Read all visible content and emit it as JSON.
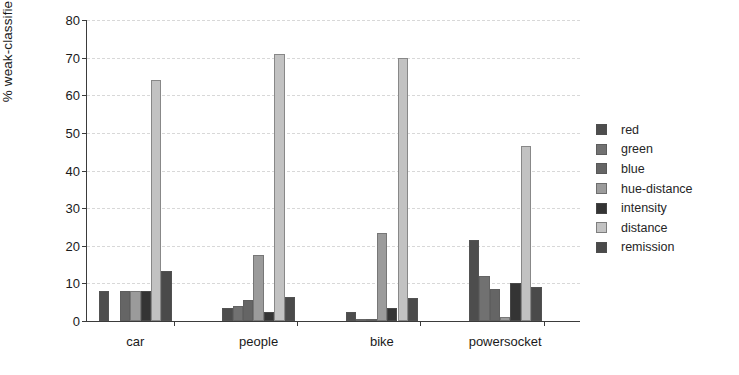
{
  "chart_data": {
    "type": "bar",
    "title": "",
    "xlabel": "",
    "ylabel": "% weak-classifier weights",
    "ylim": [
      0,
      80
    ],
    "yticks": [
      0,
      10,
      20,
      30,
      40,
      50,
      60,
      70,
      80
    ],
    "ytick_labels": [
      "0",
      "10",
      "20",
      "30",
      "40",
      "50",
      "60",
      "70",
      "80"
    ],
    "grid": true,
    "legend_position": "right",
    "categories": [
      "car",
      "people",
      "bike",
      "powersocket"
    ],
    "series": [
      {
        "name": "red",
        "color": "#4d4d4d",
        "values": [
          8.0,
          3.5,
          2.5,
          21.5
        ]
      },
      {
        "name": "green",
        "color": "#717171",
        "values": [
          0.0,
          4.0,
          0.6,
          12.0
        ]
      },
      {
        "name": "blue",
        "color": "#656565",
        "values": [
          8.0,
          5.5,
          0.6,
          8.5
        ]
      },
      {
        "name": "hue-distance",
        "color": "#9b9b9b",
        "values": [
          8.0,
          17.5,
          23.5,
          1.0
        ]
      },
      {
        "name": "intensity",
        "color": "#343434",
        "values": [
          8.0,
          2.5,
          3.5,
          10.0
        ]
      },
      {
        "name": "distance",
        "color": "#c2c2c2",
        "values": [
          64.0,
          71.0,
          69.8,
          46.5
        ]
      },
      {
        "name": "remission",
        "color": "#4a4a4a",
        "values": [
          13.3,
          6.5,
          6.0,
          9.0
        ]
      }
    ]
  },
  "axes": {
    "y_title": "% weak-classifier weights"
  },
  "legend": {
    "entries": [
      {
        "label": "red"
      },
      {
        "label": "green"
      },
      {
        "label": "blue"
      },
      {
        "label": "hue-distance"
      },
      {
        "label": "intensity"
      },
      {
        "label": "distance"
      },
      {
        "label": "remission"
      }
    ]
  }
}
